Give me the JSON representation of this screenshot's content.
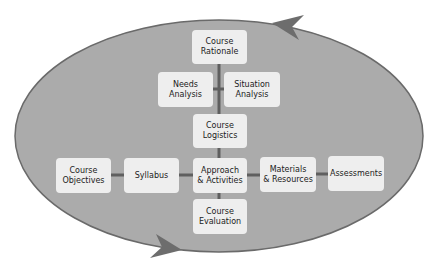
{
  "diagram": {
    "colors": {
      "ellipse_fill": "#ababab",
      "ellipse_stroke": "#6a6a6a",
      "arrow": "#6d6d6d",
      "box_fill": "#eeeeee",
      "connector": "#5f5f5f"
    },
    "nodes": {
      "course_rationale": "Course\nRationale",
      "needs_analysis": "Needs\nAnalysis",
      "situation_analysis": "Situation\nAnalysis",
      "course_logistics": "Course\nLogistics",
      "course_objectives": "Course\nObjectives",
      "syllabus": "Syllabus",
      "approach_activities": "Approach\n& Activities",
      "materials_resources": "Materials\n& Resources",
      "assessments": "Assessments",
      "course_evaluation": "Course\nEvaluation"
    }
  }
}
